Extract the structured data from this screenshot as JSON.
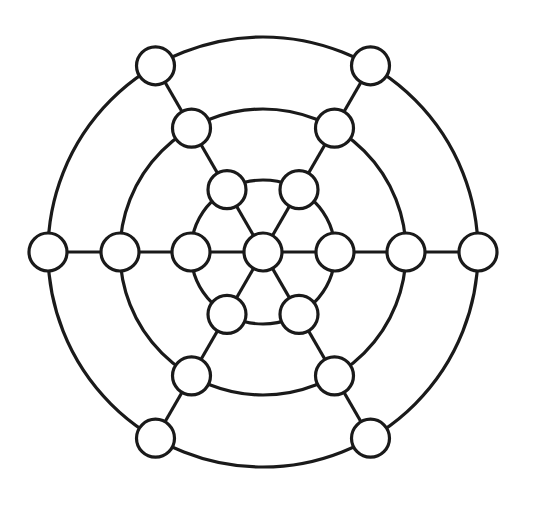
{
  "diagram": {
    "type": "concentric-graph",
    "center": [
      263,
      252
    ],
    "rings": [
      72,
      143,
      215
    ],
    "spoke_angles_deg": [
      0,
      60,
      120,
      180,
      240,
      300
    ],
    "node_radius": 19,
    "stroke_color": "#1a1a1a",
    "node_fill": "#ffffff",
    "background": "#ffffff",
    "node_count": 19
  }
}
